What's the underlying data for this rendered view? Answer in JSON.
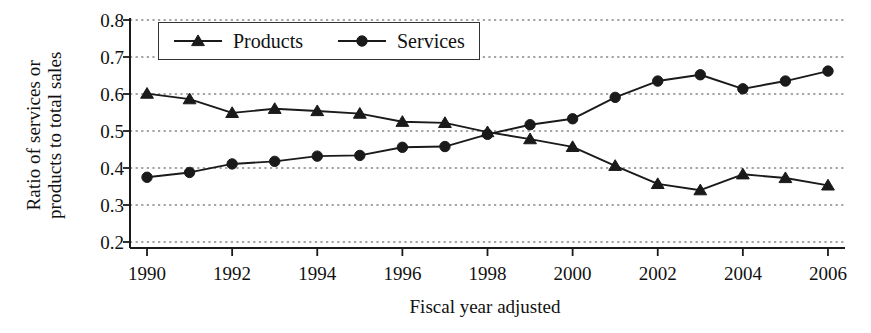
{
  "chart_data": {
    "type": "line",
    "title": "",
    "xlabel": "Fiscal year adjusted",
    "ylabel": "Ratio of services or products to total sales",
    "ylabel_lines": [
      "Ratio of services or",
      "products to total sales"
    ],
    "x": [
      1990,
      1991,
      1992,
      1993,
      1994,
      1995,
      1996,
      1997,
      1998,
      1999,
      2000,
      2001,
      2002,
      2003,
      2004,
      2005,
      2006
    ],
    "xtick_labels": [
      "1990",
      "1992",
      "1994",
      "1996",
      "1998",
      "2000",
      "2002",
      "2004",
      "2006"
    ],
    "xticks": [
      1990,
      1992,
      1994,
      1996,
      1998,
      2000,
      2002,
      2004,
      2006
    ],
    "ytick_labels": [
      "0.8",
      "0.7",
      "0.6",
      "0.5",
      "0.4",
      "0.3",
      "0.2"
    ],
    "yticks": [
      0.8,
      0.7,
      0.6,
      0.5,
      0.4,
      0.3,
      0.2
    ],
    "xlim": [
      1989.6,
      2006.4
    ],
    "ylim": [
      0.2,
      0.8
    ],
    "grid": "horizontal-dotted",
    "legend_position": "top-left-inside",
    "series": [
      {
        "name": "Products",
        "marker": "triangle",
        "color": "#1a1a1a",
        "values": [
          0.601,
          0.586,
          0.549,
          0.56,
          0.554,
          0.547,
          0.525,
          0.522,
          0.497,
          0.478,
          0.457,
          0.406,
          0.357,
          0.34,
          0.383,
          0.373,
          0.353
        ]
      },
      {
        "name": "Services",
        "marker": "circle",
        "color": "#1a1a1a",
        "values": [
          0.375,
          0.388,
          0.411,
          0.418,
          0.432,
          0.434,
          0.456,
          0.458,
          0.491,
          0.517,
          0.533,
          0.591,
          0.635,
          0.652,
          0.614,
          0.635,
          0.662
        ]
      }
    ]
  },
  "legend": {
    "items": [
      {
        "label": "Products"
      },
      {
        "label": "Services"
      }
    ]
  }
}
